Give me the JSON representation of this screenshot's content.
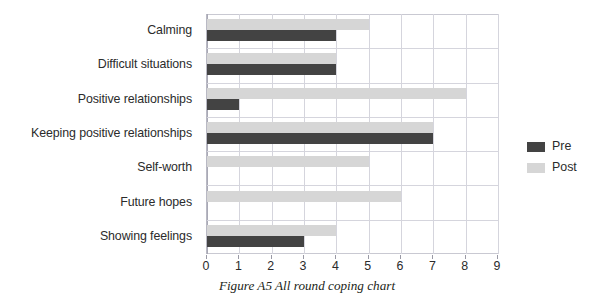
{
  "caption": "Figure A5 All round coping chart",
  "legend": {
    "position": "right",
    "entries": [
      {
        "label": "Pre",
        "color": "#434343",
        "swatch": "pre"
      },
      {
        "label": "Post",
        "color": "#d6d6d6",
        "swatch": "post"
      }
    ]
  },
  "axis": {
    "ticks": [
      "0",
      "1",
      "2",
      "3",
      "4",
      "5",
      "6",
      "7",
      "8",
      "9"
    ]
  },
  "chart_data": {
    "type": "bar",
    "orientation": "horizontal",
    "title": "",
    "caption": "Figure A5 All round coping chart",
    "xlabel": "",
    "ylabel": "",
    "xlim": [
      0,
      9
    ],
    "xticks": [
      0,
      1,
      2,
      3,
      4,
      5,
      6,
      7,
      8,
      9
    ],
    "grid": true,
    "grid_axis": "both",
    "legend": [
      "Pre",
      "Post"
    ],
    "legend_position": "right",
    "categories": [
      "Calming",
      "Difficult situations",
      "Positive relationships",
      "Keeping positive relationships",
      "Self-worth",
      "Future hopes",
      "Showing feelings"
    ],
    "series": [
      {
        "name": "Pre",
        "color": "#434343",
        "values": [
          4,
          4,
          1,
          7,
          0,
          0,
          3
        ]
      },
      {
        "name": "Post",
        "color": "#d6d6d6",
        "values": [
          5,
          4,
          8,
          7,
          5,
          6,
          4
        ]
      }
    ]
  }
}
